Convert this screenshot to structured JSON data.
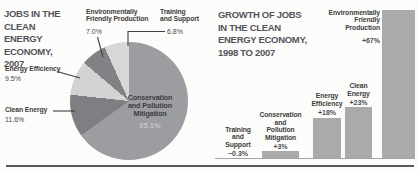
{
  "infographic": {
    "left": {
      "title": "JOBS IN THE\nCLEAN ENERGY\nECONOMY,\n2007",
      "center_label": "Conservation\nand Pollution\nMitigation",
      "center_value": "65.1%",
      "callouts": {
        "env_friendly": {
          "label": "Environmentally\nFriendly Production",
          "value": "7.0%"
        },
        "training": {
          "label": "Training\nand Support",
          "value": "6.8%"
        },
        "energy_eff": {
          "label": "Energy Efficiency",
          "value": "9.5%"
        },
        "clean_energy": {
          "label": "Clean Energy",
          "value": "11.6%"
        }
      },
      "slices": [
        {
          "label": "Conservation and Pollution Mitigation",
          "value": 65.1,
          "color": "#9b9da0"
        },
        {
          "label": "Clean Energy",
          "value": 11.6,
          "color": "#7d7f82"
        },
        {
          "label": "Energy Efficiency",
          "value": 9.5,
          "color": "#d2d3d3"
        },
        {
          "label": "Environmentally Friendly Production",
          "value": 7.0,
          "color": "#808285"
        },
        {
          "label": "Training and Support",
          "value": 6.8,
          "color": "#d6d7d6"
        }
      ]
    },
    "right": {
      "title": "GROWTH OF JOBS\nIN THE CLEAN\nENERGY ECONOMY,\n1998 TO 2007",
      "bar_color": "#a8aaac",
      "items": [
        {
          "label": "Training\nand\nSupport",
          "value": -0.3,
          "display": "−0.3%"
        },
        {
          "label": "Conservation\nand\nPollution\nMitigation",
          "value": 3,
          "display": "+3%"
        },
        {
          "label": "Energy\nEfficiency",
          "value": 18,
          "display": "+18%"
        },
        {
          "label": "Clean\nEnergy",
          "value": 23,
          "display": "+23%"
        },
        {
          "label": "Environmentally\nFriendly\nProduction",
          "value": 67,
          "display": "+67%"
        }
      ]
    }
  },
  "chart_data": [
    {
      "type": "pie",
      "title": "JOBS IN THE CLEAN ENERGY ECONOMY, 2007",
      "labels": [
        "Conservation and Pollution Mitigation",
        "Clean Energy",
        "Energy Efficiency",
        "Environmentally Friendly Production",
        "Training and Support"
      ],
      "values": [
        65.1,
        11.6,
        9.5,
        7.0,
        6.8
      ],
      "unit": "%",
      "legend_position": "callout-labels",
      "start_angle_deg": 0,
      "direction": "clockwise"
    },
    {
      "type": "bar",
      "title": "GROWTH OF JOBS IN THE CLEAN ENERGY ECONOMY, 1998 TO 2007",
      "categories": [
        "Training and Support",
        "Conservation and Pollution Mitigation",
        "Energy Efficiency",
        "Clean Energy",
        "Environmentally Friendly Production"
      ],
      "values": [
        -0.3,
        3,
        18,
        23,
        67
      ],
      "data_labels": [
        "-0.3%",
        "+3%",
        "+18%",
        "+23%",
        "+67%"
      ],
      "unit": "%",
      "xlabel": "",
      "ylabel": "",
      "ylim": [
        0,
        67
      ],
      "grid": false,
      "axis_ticks": false
    }
  ]
}
